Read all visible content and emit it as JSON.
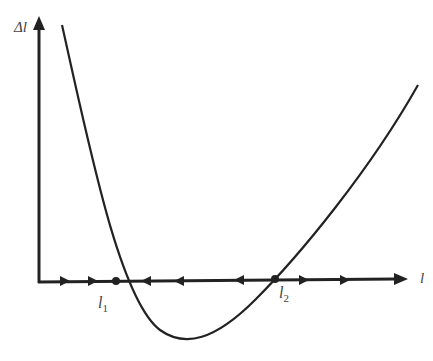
{
  "diagram": {
    "type": "phase-line-plot",
    "y_axis_label": "Δl",
    "x_axis_label": "l",
    "equilibria": [
      {
        "label": "l",
        "subscript": "1",
        "x": 116,
        "stability": "stable"
      },
      {
        "label": "l",
        "subscript": "2",
        "x": 275,
        "stability": "unstable"
      }
    ],
    "flow_arrows": [
      {
        "x": 63,
        "direction": "right"
      },
      {
        "x": 92,
        "direction": "right"
      },
      {
        "x": 145,
        "direction": "left"
      },
      {
        "x": 178,
        "direction": "left"
      },
      {
        "x": 238,
        "direction": "left"
      },
      {
        "x": 305,
        "direction": "right"
      },
      {
        "x": 345,
        "direction": "right"
      },
      {
        "x": 395,
        "direction": "right"
      }
    ],
    "colors": {
      "line": "#222222",
      "text": "#444444"
    }
  }
}
